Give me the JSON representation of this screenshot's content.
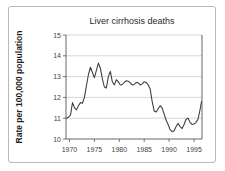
{
  "figure": {
    "background_color": "#ffffff",
    "border_color": "#b9b9b9",
    "line_color": "#3a3a3a",
    "grid_color": "#c4c4c4"
  },
  "chart_data": {
    "type": "line",
    "title": "Liver cirrhosis deaths",
    "xlabel": "",
    "ylabel": "Rate per 100,000 population",
    "xlim": [
      1969.3,
      1996.6
    ],
    "ylim": [
      10,
      15
    ],
    "yticks": [
      10,
      11,
      12,
      13,
      14,
      15
    ],
    "ytick_labels": [
      "10",
      "11",
      "12",
      "13",
      "14",
      "15"
    ],
    "xticks": [
      1970,
      1975,
      1980,
      1985,
      1990,
      1995
    ],
    "xtick_labels": [
      "1970",
      "1975",
      "1980",
      "1985",
      "1990",
      "1995"
    ],
    "grid": true,
    "grid_axis": "y",
    "legend": false,
    "series": [
      {
        "name": "Liver cirrhosis death rate",
        "x": [
          1969.4,
          1969.8,
          1970.2,
          1970.6,
          1971.0,
          1971.4,
          1971.8,
          1972.2,
          1972.6,
          1973.0,
          1973.4,
          1973.8,
          1974.2,
          1974.6,
          1975.0,
          1975.4,
          1975.8,
          1976.2,
          1976.6,
          1977.0,
          1977.4,
          1977.8,
          1978.2,
          1978.6,
          1979.0,
          1979.4,
          1979.8,
          1980.2,
          1980.6,
          1981.0,
          1981.4,
          1981.8,
          1982.2,
          1982.6,
          1983.0,
          1983.4,
          1983.8,
          1984.2,
          1984.6,
          1985.0,
          1985.4,
          1985.8,
          1986.2,
          1986.6,
          1987.0,
          1987.4,
          1987.8,
          1988.2,
          1988.6,
          1989.0,
          1989.4,
          1989.8,
          1990.2,
          1990.6,
          1991.0,
          1991.4,
          1991.8,
          1992.2,
          1992.6,
          1993.0,
          1993.4,
          1993.8,
          1994.2,
          1994.6,
          1995.0,
          1995.4,
          1995.8,
          1996.2,
          1996.5
        ],
        "y": [
          11.0,
          11.05,
          11.15,
          11.75,
          11.5,
          11.4,
          11.6,
          11.75,
          11.72,
          12.0,
          12.55,
          13.1,
          13.45,
          13.2,
          12.95,
          13.3,
          13.65,
          13.4,
          12.9,
          12.5,
          12.45,
          13.0,
          13.25,
          12.75,
          12.6,
          12.85,
          12.75,
          12.6,
          12.62,
          12.72,
          12.8,
          12.78,
          12.7,
          12.6,
          12.62,
          12.72,
          12.7,
          12.6,
          12.65,
          12.75,
          12.72,
          12.6,
          12.4,
          11.8,
          11.35,
          11.3,
          11.45,
          11.6,
          11.5,
          11.2,
          10.9,
          10.7,
          10.45,
          10.35,
          10.4,
          10.6,
          10.75,
          10.6,
          10.5,
          10.7,
          10.95,
          11.0,
          10.8,
          10.7,
          10.72,
          10.8,
          10.95,
          11.4,
          11.8
        ]
      }
    ]
  }
}
